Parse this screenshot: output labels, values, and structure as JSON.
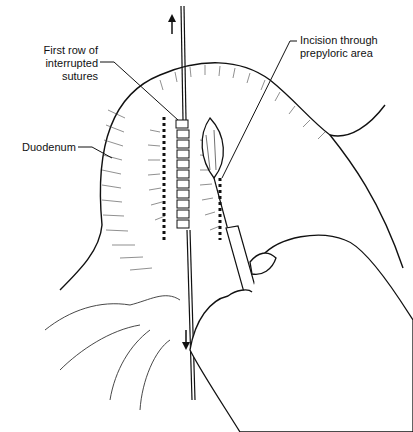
{
  "figure": {
    "labels": {
      "first_row_line1": "First row of",
      "first_row_line2": "interrupted sutures",
      "incision_line1": "Incision through",
      "incision_line2": "prepyloric area",
      "duodenum": "Duodenum"
    },
    "colors": {
      "ink": "#111111",
      "background": "#ffffff"
    }
  }
}
